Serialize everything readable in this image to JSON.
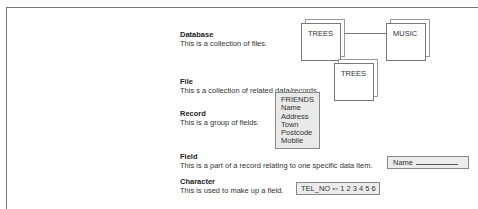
{
  "terms": [
    {
      "title": "Database",
      "description": "This is a collection of files."
    },
    {
      "title": "File",
      "description": "This s a collection of related data/records."
    },
    {
      "title": "Record",
      "description": "This is a group of fields."
    },
    {
      "title": "Field",
      "description": "This is a part of a record relating to one specific data item."
    },
    {
      "title": "Character",
      "description": "This is used to make up a field."
    }
  ],
  "diagram": {
    "database_files": [
      "TREES",
      "MUSIC"
    ],
    "file_card": "TREES",
    "record": {
      "title": "FRIENDS",
      "fields": [
        "Name",
        "Address",
        "Town",
        "Postcode",
        "Mobile"
      ]
    },
    "field_example": {
      "label": "Name"
    },
    "character_example": {
      "field": "TEL_NO",
      "arrow": "=>",
      "value": "1 2 3 4 5 6"
    }
  }
}
